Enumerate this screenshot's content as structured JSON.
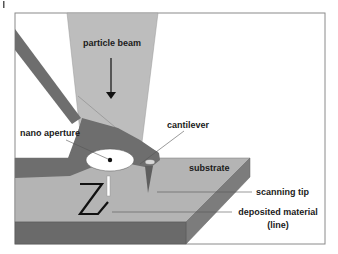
{
  "figure": {
    "type": "schematic illustration",
    "colors": {
      "background": "#ffffff",
      "frame": "#8a8a8a",
      "beam": "#bdbdbd",
      "cantilever": "#6e6e6e",
      "substrate_top": "#b4b4b4",
      "substrate_front": "#6a6a6a",
      "substrate_side": "#7c7c7c",
      "aperture": "#ffffff",
      "deposited_line": "#111111",
      "leader_lines": "#555555"
    }
  },
  "labels": {
    "particle_beam": "particle beam",
    "cantilever": "cantilever",
    "nano_aperture": "nano aperture",
    "substrate": "substrate",
    "scanning_tip": "scanning tip",
    "deposited_material": "deposited material",
    "deposited_material_sub": "(line)"
  },
  "page_marker": "|"
}
